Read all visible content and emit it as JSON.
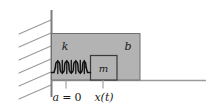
{
  "figure": {
    "kind": "mechanical-schematic",
    "background_color": "#ffffff",
    "block_fill_color": "#b3b3b3",
    "block_stroke_color": "#6b6b6b",
    "line_color": "#7a7a7a",
    "spring_color": "#111111",
    "text_color": "#1a1a1a"
  },
  "labels": {
    "spring": "k",
    "mass": "m",
    "damper": "b",
    "origin": "a = 0",
    "origin_symbol": "a",
    "origin_equals": "=",
    "origin_value": "0",
    "displacement": "x(t)"
  },
  "geometry": {
    "wall_x": 51,
    "wall_top_y": 10,
    "wall_bottom_y": 97,
    "ground_y": 80,
    "ground_right_x": 206,
    "outer_block": {
      "x": 51,
      "y": 33,
      "width": 89,
      "height": 47
    },
    "inner_block": {
      "x": 90,
      "y": 55,
      "width": 27,
      "height": 25
    },
    "spring": {
      "x1": 53,
      "x2": 90,
      "y": 67,
      "coils": 8
    },
    "hatch_lines": 6
  },
  "ticks": [
    {
      "name": "origin-tick",
      "x": 66,
      "y1": 80,
      "y2": 88
    },
    {
      "name": "displacement-tick",
      "x": 103,
      "y1": 80,
      "y2": 88
    }
  ]
}
